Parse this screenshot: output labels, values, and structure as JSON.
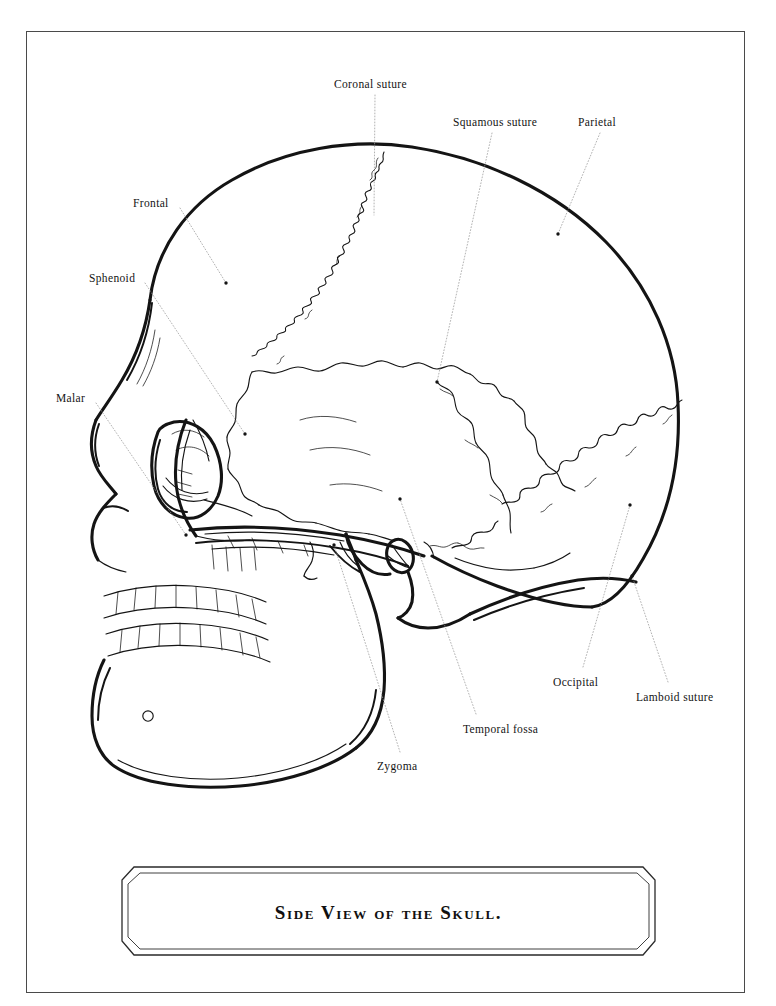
{
  "plate": {
    "caption": "Side View of the Skull.",
    "ink_color": "#141414",
    "leader_color": "#9a9a9a",
    "border_color": "#4a4a4a",
    "background": "#ffffff"
  },
  "labels": [
    {
      "id": "coronal-suture",
      "text": "Coronal suture",
      "x": 334,
      "y": 79,
      "anchor": "start",
      "leader": {
        "from": [
          375,
          95
        ],
        "to": [
          374,
          215
        ]
      },
      "dot": false
    },
    {
      "id": "squamous-suture",
      "text": "Squamous suture",
      "x": 453,
      "y": 117,
      "anchor": "start",
      "leader": {
        "from": [
          492,
          133
        ],
        "to": [
          437,
          382
        ]
      },
      "dot": true
    },
    {
      "id": "parietal",
      "text": "Parietal",
      "x": 578,
      "y": 117,
      "anchor": "start",
      "leader": {
        "from": [
          600,
          133
        ],
        "to": [
          558,
          234
        ]
      },
      "dot": true
    },
    {
      "id": "frontal",
      "text": "Frontal",
      "x": 133,
      "y": 198,
      "anchor": "start",
      "leader": {
        "from": [
          180,
          208
        ],
        "to": [
          226,
          283
        ]
      },
      "dot": true
    },
    {
      "id": "sphenoid",
      "text": "Sphenoid",
      "x": 89,
      "y": 273,
      "anchor": "start",
      "leader": {
        "from": [
          145,
          283
        ],
        "to": [
          245,
          434
        ]
      },
      "dot": true
    },
    {
      "id": "malar",
      "text": "Malar",
      "x": 56,
      "y": 393,
      "anchor": "start",
      "leader": {
        "from": [
          96,
          403
        ],
        "to": [
          186,
          535
        ]
      },
      "dot": true
    },
    {
      "id": "zygoma",
      "text": "Zygoma",
      "x": 377,
      "y": 761,
      "anchor": "start",
      "leader": {
        "from": [
          400,
          752
        ],
        "to": [
          334,
          545
        ]
      },
      "dot": true
    },
    {
      "id": "temporal-fossa",
      "text": "Temporal fossa",
      "x": 463,
      "y": 724,
      "anchor": "start",
      "leader": {
        "from": [
          476,
          714
        ],
        "to": [
          400,
          499
        ]
      },
      "dot": true
    },
    {
      "id": "occipital",
      "text": "Occipital",
      "x": 553,
      "y": 677,
      "anchor": "start",
      "leader": {
        "from": [
          583,
          667
        ],
        "to": [
          630,
          505
        ]
      },
      "dot": true
    },
    {
      "id": "lamboid-suture",
      "text": "Lamboid suture",
      "x": 636,
      "y": 692,
      "anchor": "start",
      "leader": {
        "from": [
          668,
          682
        ],
        "to": [
          632,
          576
        ]
      },
      "dot": true
    }
  ]
}
